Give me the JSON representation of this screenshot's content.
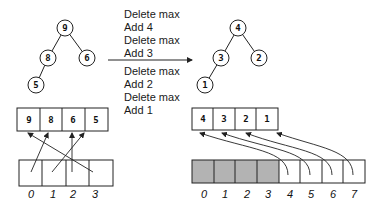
{
  "operations": {
    "group1": [
      "Delete max",
      "Add 4",
      "Delete max",
      "Add 3"
    ],
    "group2": [
      "Delete max",
      "Add 2",
      "Delete max",
      "Add 1"
    ]
  },
  "left": {
    "tree_nodes": [
      "9",
      "8",
      "6",
      "5"
    ],
    "heap_array": [
      "9",
      "8",
      "6",
      "5"
    ],
    "indices": [
      "0",
      "1",
      "2",
      "3"
    ]
  },
  "right": {
    "tree_nodes": [
      "4",
      "3",
      "2",
      "1"
    ],
    "result_array": [
      "4",
      "3",
      "2",
      "1"
    ],
    "indices": [
      "0",
      "1",
      "2",
      "3",
      "4",
      "5",
      "6",
      "7"
    ],
    "shaded_count": 4
  },
  "colors": {
    "stroke": "#222222",
    "shaded": "#b3b3b3"
  }
}
